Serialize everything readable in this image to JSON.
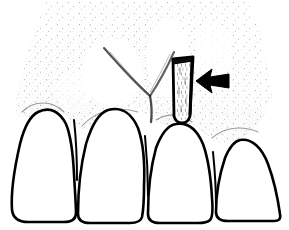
{
  "figure": {
    "title": "Interdental wedge placement in gingival embrasure",
    "style": "stippled pen-and-ink medical illustration",
    "width": 289,
    "height": 230,
    "background_color": "#ffffff",
    "ink_color": "#000000",
    "stipple_color": "#1a1a1a",
    "has_text_labels": false,
    "label_text": ""
  },
  "anatomy": {
    "gingiva": {
      "name": "gingiva",
      "description": "stippled gum tissue occupying upper region, fading toward upper-left and right edges",
      "fill": "#ffffff",
      "stipple_density": "medium",
      "papilla_count": 3,
      "crease_shape": "V"
    },
    "teeth": [
      {
        "index": 1,
        "name": "tooth-1",
        "position": "far-left",
        "x_left": 12,
        "x_right": 74,
        "crown_top_y": 112,
        "base_y": 221,
        "fill": "#ffffff",
        "outline": "#000000",
        "clipped": true
      },
      {
        "index": 2,
        "name": "tooth-2",
        "position": "left-center",
        "x_left": 74,
        "x_right": 144,
        "crown_top_y": 110,
        "base_y": 222,
        "fill": "#ffffff",
        "outline": "#000000",
        "clipped": false
      },
      {
        "index": 3,
        "name": "tooth-3",
        "position": "right-center",
        "x_left": 145,
        "x_right": 212,
        "crown_top_y": 124,
        "base_y": 222,
        "fill": "#ffffff",
        "outline": "#000000",
        "clipped": false
      },
      {
        "index": 4,
        "name": "tooth-4",
        "position": "far-right",
        "x_left": 213,
        "x_right": 283,
        "crown_top_y": 140,
        "base_y": 220,
        "fill": "#ffffff",
        "outline": "#000000",
        "clipped": true
      }
    ]
  },
  "instrument": {
    "name": "wedge",
    "description": "narrow tapered wooden wedge inserted into the interdental embrasure",
    "shape": "elongated tapered quadrilateral",
    "x_left": 169,
    "x_right": 195,
    "y_top": 57,
    "y_bottom": 123,
    "fill": "#ffffff",
    "outline": "#000000",
    "outline_weight": 2,
    "interior_texture": "light vertical stipple grain"
  },
  "annotations": {
    "arrow": {
      "name": "pointer-arrow",
      "direction": "left",
      "style": "solid filled triangle with tail",
      "color": "#000000",
      "tip_x": 196,
      "tip_y": 81,
      "tail_x": 229,
      "tail_y": 81,
      "points_to": "wedge"
    }
  },
  "legend": {
    "visible": false,
    "entries": []
  }
}
